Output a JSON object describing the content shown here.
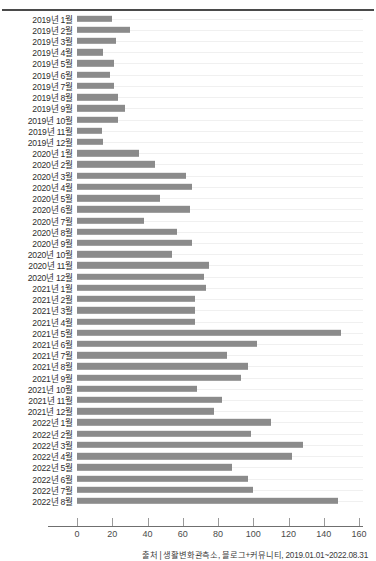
{
  "chart_data": {
    "type": "bar",
    "orientation": "horizontal",
    "title": "",
    "xlabel": "",
    "ylabel": "",
    "xlim": [
      0,
      160
    ],
    "xticks": [
      0,
      20,
      40,
      60,
      80,
      100,
      120,
      140,
      160
    ],
    "grid": false,
    "legend": null,
    "bar_color": "#8b8b8b",
    "categories": [
      "2019년 1월",
      "2019년 2월",
      "2019년 3월",
      "2019년 4월",
      "2019년 5월",
      "2019년 6월",
      "2019년 7월",
      "2019년 8월",
      "2019년 9월",
      "2019년 10월",
      "2019년 11월",
      "2019년 12월",
      "2020년 1월",
      "2020년 2월",
      "2020년 3월",
      "2020년 4월",
      "2020년 5월",
      "2020년 6월",
      "2020년 7월",
      "2020년 8월",
      "2020년 9월",
      "2020년 10월",
      "2020년 11월",
      "2020년 12월",
      "2021년 1월",
      "2021년 2월",
      "2021년 3월",
      "2021년 4월",
      "2021년 5월",
      "2021년 6월",
      "2021년 7월",
      "2021년 8월",
      "2021년 9월",
      "2021년 10월",
      "2021년 11월",
      "2021년 12월",
      "2022년 1월",
      "2022년 2월",
      "2022년 3월",
      "2022년 4월",
      "2022년 5월",
      "2022년 6월",
      "2022년 7월",
      "2022년 8월"
    ],
    "values": [
      20,
      30,
      22,
      15,
      21,
      19,
      21,
      23,
      27,
      23,
      14,
      15,
      35,
      44,
      62,
      65,
      47,
      64,
      38,
      57,
      65,
      54,
      75,
      72,
      73,
      67,
      67,
      67,
      150,
      102,
      85,
      97,
      93,
      68,
      82,
      78,
      110,
      99,
      128,
      122,
      88,
      97,
      100,
      148
    ]
  },
  "source": {
    "text": "출처 | 생활변화관측소, 블로그+커뮤니티, 2019.01.01~2022.08.31"
  },
  "header": {
    "clipped_title": ""
  }
}
